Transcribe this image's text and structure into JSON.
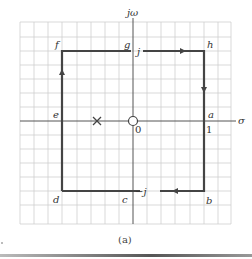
{
  "figure": {
    "caption": "(a)",
    "axes": {
      "vertical_label": "jω",
      "horizontal_label": "σ",
      "origin_label": "0",
      "unit_label_real": "1",
      "unit_label_imag_pos": "j",
      "unit_label_imag_neg": "−j"
    },
    "contour_points": [
      {
        "name": "a",
        "re": 1,
        "im": 0
      },
      {
        "name": "b",
        "re": 1,
        "im": -1
      },
      {
        "name": "c",
        "re": 0,
        "im": -1
      },
      {
        "name": "d",
        "re": -1,
        "im": -1
      },
      {
        "name": "e",
        "re": -1,
        "im": 0
      },
      {
        "name": "f",
        "re": -1,
        "im": 1
      },
      {
        "name": "g",
        "re": 0,
        "im": 1
      },
      {
        "name": "h",
        "re": 1,
        "im": 1
      }
    ],
    "pole": {
      "symbol": "×",
      "re": -0.5,
      "im": 0
    },
    "zero": {
      "symbol": "○",
      "re": 0,
      "im": 0
    },
    "direction": "clockwise",
    "colors": {
      "grid": "#c8c8c8",
      "contour": "#444444",
      "axis": "#555555"
    }
  }
}
